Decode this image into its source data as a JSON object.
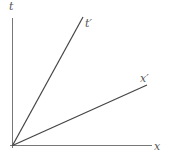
{
  "diagram": {
    "title": "",
    "type": "spacetime-diagram",
    "colors": {
      "axis": "#777777",
      "line": "#444444",
      "label": "#555555",
      "background": "#ffffff"
    },
    "axes": {
      "vertical": {
        "label": "t"
      },
      "horizontal": {
        "label": "x"
      }
    },
    "lines": [
      {
        "id": "t-prime",
        "label": "t′"
      },
      {
        "id": "x-prime",
        "label": "x′"
      }
    ]
  }
}
